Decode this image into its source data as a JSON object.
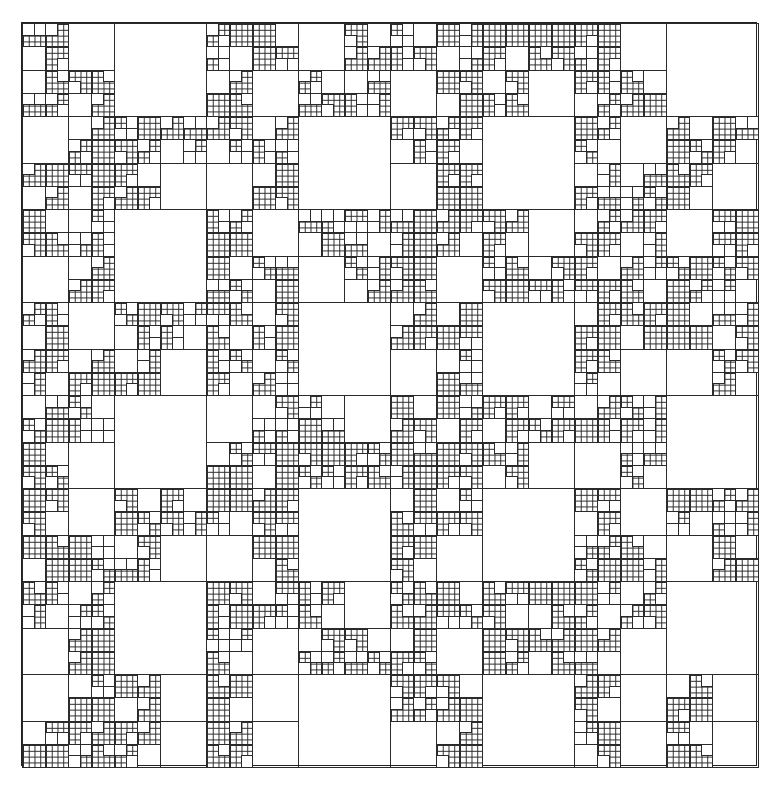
{
  "figure": {
    "type": "recursive square subdivision (quadtree tiling)",
    "grid": 8,
    "levels": [
      "92px empty square",
      "46px empty square",
      "23px empty square",
      "11.5px empty square",
      "5.75px fine cell"
    ],
    "coarse_map": [
      [
        "SMSS",
        "B",
        "SSSM",
        "MSSS",
        "SSMS",
        "SSSM",
        "SMSS",
        "B"
      ],
      [
        "MSSS",
        "SSSM",
        "SSMS",
        "B",
        "SSMS",
        "B",
        "SMSS",
        "SSSM"
      ],
      [
        "SSMS",
        "B",
        "SMSS",
        "SSMS",
        "SSSM",
        "SMSS",
        "SSSS",
        "MSSS"
      ],
      [
        "SMSS",
        "SSSM",
        "SSSS",
        "B",
        "SSMS",
        "B",
        "SSSM",
        "SSMS"
      ],
      [
        "SSSM",
        "B",
        "MSSS",
        "SMSS",
        "SSSS",
        "SSSM",
        "SSMS",
        "B"
      ],
      [
        "SMSS",
        "SSSM",
        "SSMS",
        "B",
        "SSSM",
        "B",
        "SMSS",
        "SSMS"
      ],
      [
        "SSMS",
        "B",
        "SSSM",
        "SMSS",
        "SSSM",
        "SSSS",
        "SSSM",
        "B"
      ],
      [
        "MSSS",
        "SMSM",
        "SMSM",
        "B",
        "SSMS",
        "B",
        "SMSM",
        "SMSM"
      ]
    ],
    "line_color": "#2a2a2a",
    "background": "#ffffff"
  }
}
